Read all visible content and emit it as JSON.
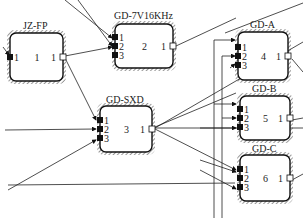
{
  "blocks": [
    {
      "id": "jzfp",
      "title": "JZ-FP",
      "x": 10,
      "y": 33,
      "w": 53,
      "h": 48,
      "inputs": [
        "1"
      ],
      "index": "1",
      "output": "1",
      "title_x": 23,
      "title_y": 29
    },
    {
      "id": "gd7v",
      "title": "GD-7V16KHz",
      "x": 115,
      "y": 24,
      "w": 58,
      "h": 44,
      "inputs": [
        "1",
        "2",
        "3"
      ],
      "index": "2",
      "output": "1",
      "title_x": 114,
      "title_y": 19
    },
    {
      "id": "gda",
      "title": "GD-A",
      "x": 238,
      "y": 32,
      "w": 50,
      "h": 48,
      "inputs": [
        "1",
        "2",
        "3"
      ],
      "index": "4",
      "output": "1",
      "title_x": 250,
      "title_y": 28
    },
    {
      "id": "gdsxd",
      "title": "GD-SXD",
      "x": 100,
      "y": 106,
      "w": 52,
      "h": 46,
      "inputs": [
        "1",
        "2",
        "3"
      ],
      "index": "3",
      "output": "1",
      "title_x": 106,
      "title_y": 103
    },
    {
      "id": "gdb",
      "title": "GD-B",
      "x": 240,
      "y": 96,
      "w": 50,
      "h": 44,
      "inputs": [
        "1",
        "2",
        "3"
      ],
      "index": "5",
      "output": "1",
      "title_x": 252,
      "title_y": 92
    },
    {
      "id": "gdc",
      "title": "GD-C",
      "x": 240,
      "y": 155,
      "w": 50,
      "h": 46,
      "inputs": [
        "1",
        "2",
        "3"
      ],
      "index": "6",
      "output": "1",
      "title_x": 252,
      "title_y": 152
    }
  ]
}
